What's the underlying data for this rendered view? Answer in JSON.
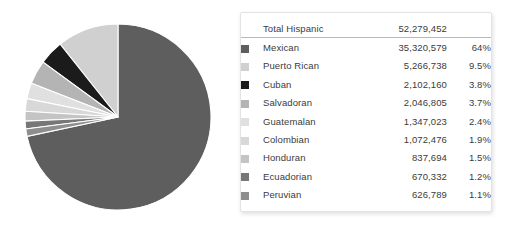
{
  "chart_data": {
    "type": "pie",
    "title": "",
    "total_label": "Total Hispanic",
    "total_value": "52,279,452",
    "categories": [
      "Mexican",
      "Puerto Rican",
      "Cuban",
      "Salvadoran",
      "Guatemalan",
      "Colombian",
      "Honduran",
      "Ecuadorian",
      "Peruvian"
    ],
    "values": [
      35320579,
      5266738,
      2102160,
      2046805,
      1347023,
      1072476,
      837694,
      670332,
      626789
    ],
    "percents": [
      64,
      9.5,
      3.8,
      3.7,
      2.4,
      1.9,
      1.5,
      1.2,
      1.1
    ],
    "colors": [
      "#5e5e5e",
      "#d0d0d0",
      "#1b1b1b",
      "#b4b4b4",
      "#e0e0e0",
      "#d8d8d8",
      "#c4c4c4",
      "#777777",
      "#8e8e8e"
    ],
    "legend_position": "right",
    "grid": false,
    "start_angle_deg": 0,
    "direction": "clockwise-major"
  },
  "legend": {
    "total": {
      "label": "Total Hispanic",
      "value": "52,279,452",
      "percent": ""
    },
    "rows": [
      {
        "label": "Mexican",
        "value": "35,320,579",
        "percent": "64%",
        "color": "#5e5e5e"
      },
      {
        "label": "Puerto Rican",
        "value": "5,266,738",
        "percent": "9.5%",
        "color": "#d0d0d0"
      },
      {
        "label": "Cuban",
        "value": "2,102,160",
        "percent": "3.8%",
        "color": "#1b1b1b"
      },
      {
        "label": "Salvadoran",
        "value": "2,046,805",
        "percent": "3.7%",
        "color": "#b4b4b4"
      },
      {
        "label": "Guatemalan",
        "value": "1,347,023",
        "percent": "2.4%",
        "color": "#e0e0e0"
      },
      {
        "label": "Colombian",
        "value": "1,072,476",
        "percent": "1.9%",
        "color": "#d8d8d8"
      },
      {
        "label": "Honduran",
        "value": "837,694",
        "percent": "1.5%",
        "color": "#c4c4c4"
      },
      {
        "label": "Ecuadorian",
        "value": "670,332",
        "percent": "1.2%",
        "color": "#777777"
      },
      {
        "label": "Peruvian",
        "value": "626,789",
        "percent": "1.1%",
        "color": "#8e8e8e"
      }
    ]
  }
}
